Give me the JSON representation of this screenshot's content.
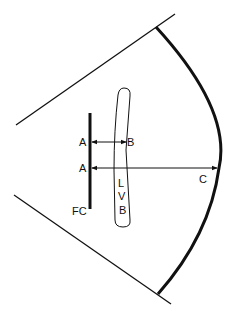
{
  "diagram": {
    "labels": {
      "a_upper": "A",
      "b": "B",
      "a_lower": "A",
      "c": "C",
      "l": "L",
      "v": "V",
      "b_lvb": "B",
      "fc": "FC"
    },
    "elements": {
      "sector_boundary_lines": 2,
      "arc": "far-field sector arc",
      "bar": "FC",
      "tube": "LVB",
      "arrows": [
        "A-B",
        "A-C"
      ]
    },
    "colors": {
      "line": "#111111",
      "background": "#ffffff"
    }
  }
}
